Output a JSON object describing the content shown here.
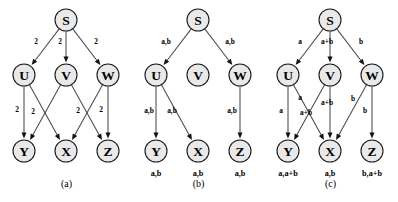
{
  "figure": {
    "panels": [
      {
        "id": "a",
        "caption": "(a)",
        "nodes": [
          {
            "id": "S",
            "label": "S",
            "x": 66,
            "y": 20
          },
          {
            "id": "U",
            "label": "U",
            "x": 24,
            "y": 75
          },
          {
            "id": "V",
            "label": "V",
            "x": 66,
            "y": 75
          },
          {
            "id": "W",
            "label": "W",
            "x": 108,
            "y": 75
          },
          {
            "id": "Y",
            "label": "Y",
            "x": 24,
            "y": 151
          },
          {
            "id": "X",
            "label": "X",
            "x": 66,
            "y": 151
          },
          {
            "id": "Z",
            "label": "Z",
            "x": 108,
            "y": 151
          }
        ],
        "edges": [
          {
            "from": "S",
            "to": "U",
            "label": "2",
            "lx": 36,
            "ly": 44
          },
          {
            "from": "S",
            "to": "V",
            "label": "2",
            "lx": 60,
            "ly": 44
          },
          {
            "from": "S",
            "to": "W",
            "label": "2",
            "lx": 96,
            "ly": 44
          },
          {
            "from": "U",
            "to": "Y",
            "label": "2",
            "lx": 17,
            "ly": 112
          },
          {
            "from": "U",
            "to": "X",
            "label": "2",
            "lx": 33,
            "ly": 114
          },
          {
            "from": "V",
            "to": "Y",
            "label": "",
            "lx": 0,
            "ly": 0
          },
          {
            "from": "V",
            "to": "Z",
            "label": "2",
            "lx": 78,
            "ly": 113
          },
          {
            "from": "W",
            "to": "X",
            "label": "",
            "lx": 0,
            "ly": 0
          },
          {
            "from": "W",
            "to": "Z",
            "label": "2",
            "lx": 101,
            "ly": 112
          }
        ],
        "sink_labels": []
      },
      {
        "id": "b",
        "caption": "(b)",
        "nodes": [
          {
            "id": "S",
            "label": "S",
            "x": 66,
            "y": 20
          },
          {
            "id": "U",
            "label": "U",
            "x": 24,
            "y": 75
          },
          {
            "id": "V",
            "label": "V",
            "x": 66,
            "y": 75
          },
          {
            "id": "W",
            "label": "W",
            "x": 108,
            "y": 75
          },
          {
            "id": "Y",
            "label": "Y",
            "x": 24,
            "y": 151
          },
          {
            "id": "X",
            "label": "X",
            "x": 66,
            "y": 151
          },
          {
            "id": "Z",
            "label": "Z",
            "x": 108,
            "y": 151
          }
        ],
        "edges": [
          {
            "from": "S",
            "to": "U",
            "label": "a,b",
            "lx": 34,
            "ly": 44
          },
          {
            "from": "S",
            "to": "W",
            "label": "a,b",
            "lx": 98,
            "ly": 44
          },
          {
            "from": "U",
            "to": "Y",
            "label": "a,b",
            "lx": 17,
            "ly": 113
          },
          {
            "from": "U",
            "to": "X",
            "label": "a,b",
            "lx": 40,
            "ly": 113
          },
          {
            "from": "W",
            "to": "Z",
            "label": "a,b",
            "lx": 100,
            "ly": 113
          }
        ],
        "sink_labels": [
          {
            "text": "a,b",
            "x": 24,
            "y": 176
          },
          {
            "text": "a,b",
            "x": 66,
            "y": 176
          },
          {
            "text": "a,b",
            "x": 108,
            "y": 176
          }
        ]
      },
      {
        "id": "c",
        "caption": "(c)",
        "nodes": [
          {
            "id": "S",
            "label": "S",
            "x": 66,
            "y": 20
          },
          {
            "id": "U",
            "label": "U",
            "x": 24,
            "y": 75
          },
          {
            "id": "V",
            "label": "V",
            "x": 66,
            "y": 75
          },
          {
            "id": "W",
            "label": "W",
            "x": 108,
            "y": 75
          },
          {
            "id": "Y",
            "label": "Y",
            "x": 24,
            "y": 151
          },
          {
            "id": "X",
            "label": "X",
            "x": 66,
            "y": 151
          },
          {
            "id": "Z",
            "label": "Z",
            "x": 108,
            "y": 151
          }
        ],
        "edges": [
          {
            "from": "S",
            "to": "U",
            "label": "a",
            "lx": 36,
            "ly": 44
          },
          {
            "from": "S",
            "to": "V",
            "label": "a+b",
            "lx": 63,
            "ly": 44
          },
          {
            "from": "S",
            "to": "W",
            "label": "b",
            "lx": 97,
            "ly": 44
          },
          {
            "from": "U",
            "to": "Y",
            "label": "a",
            "lx": 17,
            "ly": 113
          },
          {
            "from": "U",
            "to": "X",
            "label": "a",
            "lx": 36,
            "ly": 100
          },
          {
            "from": "V",
            "to": "Y",
            "label": "a+b",
            "lx": 42,
            "ly": 115
          },
          {
            "from": "V",
            "to": "X",
            "label": "a+b",
            "lx": 63,
            "ly": 105
          },
          {
            "from": "W",
            "to": "X",
            "label": "b",
            "lx": 89,
            "ly": 101
          },
          {
            "from": "W",
            "to": "Z",
            "label": "b",
            "lx": 101,
            "ly": 113
          }
        ],
        "sink_labels": [
          {
            "text": "a,a+b",
            "x": 24,
            "y": 176
          },
          {
            "text": "a,b",
            "x": 66,
            "y": 176
          },
          {
            "text": "b,a+b",
            "x": 108,
            "y": 176
          }
        ]
      }
    ],
    "node_radius": 11,
    "colors": {
      "node_fill": "#e9e9e9",
      "node_stroke": "#1a1a1a",
      "edge": "#4a4a4a",
      "text": "#000000",
      "background": "#ffffff"
    }
  }
}
